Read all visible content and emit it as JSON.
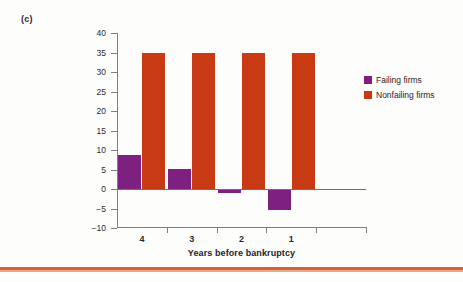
{
  "panel": {
    "label": "(c)"
  },
  "chart_data": {
    "type": "bar",
    "title": "",
    "subtitle": "",
    "xlabel": "Years before bankruptcy",
    "ylabel": "EBITDA as % of total liabilities",
    "categories": [
      "4",
      "3",
      "2",
      "1"
    ],
    "series": [
      {
        "name": "Failing firms",
        "color": "#7e2080",
        "values": [
          8.7,
          5.2,
          -1.0,
          -5.4
        ]
      },
      {
        "name": "Nonfailing firms",
        "color": "#c73a14",
        "values": [
          35.0,
          35.0,
          35.0,
          35.0
        ]
      }
    ],
    "ylim": [
      -10,
      40
    ],
    "yticks": [
      40,
      35,
      30,
      25,
      20,
      15,
      10,
      5,
      0,
      "−5",
      "−10"
    ],
    "ytick_values": [
      40,
      35,
      30,
      25,
      20,
      15,
      10,
      5,
      0,
      -5,
      -10
    ],
    "grid": false,
    "legend_position": "right",
    "zero_line": true
  },
  "legend": {
    "items": [
      {
        "label": "Failing firms",
        "color": "#7e2080"
      },
      {
        "label": "Nonfailing firms",
        "color": "#c73a14"
      }
    ]
  },
  "colors": {
    "failing": "#7e2080",
    "nonfailing": "#c73a14",
    "axis": "#7d7f86",
    "text": "#23232b",
    "rule": "#d4603a",
    "background": "#fdfdfc"
  }
}
